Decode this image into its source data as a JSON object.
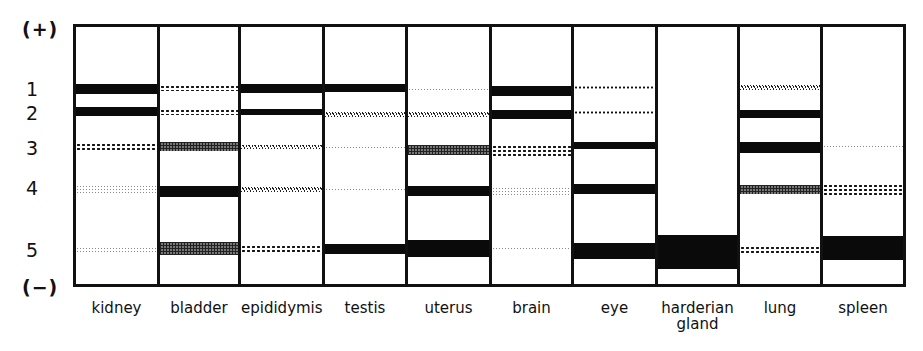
{
  "figure": {
    "pole_top": "(+)",
    "pole_bottom": "(−)",
    "band_numbers": [
      {
        "label": "1",
        "y": 78
      },
      {
        "label": "2",
        "y": 102
      },
      {
        "label": "3",
        "y": 137
      },
      {
        "label": "4",
        "y": 177
      },
      {
        "label": "5",
        "y": 239
      }
    ],
    "pattern_legend": {
      "solid": "solid black (strong)",
      "dense": "dense crosshatch (medium-strong)",
      "dotted": "coarse dots (medium)",
      "wavy": "wavy stipple (weak-medium)",
      "light": "fine grey stipple (weak)",
      "thin": "thin dotted line (trace)"
    },
    "band_rows": {
      "1": {
        "top": 84,
        "height": 9
      },
      "2": {
        "top": 108,
        "height": 8
      },
      "3": {
        "top": 143,
        "height": 10
      },
      "4": {
        "top": 184,
        "height": 12
      },
      "5": {
        "top": 241,
        "height": 15
      }
    },
    "lanes": [
      {
        "label": "kidney",
        "label2": "",
        "x": 76,
        "w": 81,
        "bands": [
          {
            "row": 1,
            "pattern": "solid",
            "top": 84,
            "height": 10
          },
          {
            "row": 2,
            "pattern": "solid",
            "top": 107,
            "height": 9
          },
          {
            "row": 3,
            "pattern": "dotted",
            "top": 143,
            "height": 9
          },
          {
            "row": 4,
            "pattern": "light",
            "top": 185,
            "height": 8
          },
          {
            "row": 5,
            "pattern": "light",
            "top": 247,
            "height": 5
          }
        ]
      },
      {
        "label": "bladder",
        "label2": "",
        "x": 160,
        "w": 78,
        "bands": [
          {
            "row": 1,
            "pattern": "dotted",
            "top": 85,
            "height": 6
          },
          {
            "row": 2,
            "pattern": "dotted",
            "top": 109,
            "height": 6
          },
          {
            "row": 3,
            "pattern": "dense",
            "top": 142,
            "height": 9
          },
          {
            "row": 4,
            "pattern": "solid",
            "top": 186,
            "height": 11
          },
          {
            "row": 5,
            "pattern": "dense",
            "top": 242,
            "height": 13
          }
        ]
      },
      {
        "label": "epididymis",
        "label2": "",
        "x": 241,
        "w": 81,
        "bands": [
          {
            "row": 1,
            "pattern": "solid",
            "top": 84,
            "height": 9
          },
          {
            "row": 2,
            "pattern": "solid",
            "top": 109,
            "height": 6
          },
          {
            "row": 3,
            "pattern": "wavy",
            "top": 145,
            "height": 4
          },
          {
            "row": 4,
            "pattern": "wavy",
            "top": 187,
            "height": 5
          },
          {
            "row": 5,
            "pattern": "dotted",
            "top": 245,
            "height": 9
          }
        ]
      },
      {
        "label": "testis",
        "label2": "",
        "x": 325,
        "w": 80,
        "bands": [
          {
            "row": 1,
            "pattern": "solid",
            "top": 84,
            "height": 8
          },
          {
            "row": 2,
            "pattern": "wavy",
            "top": 112,
            "height": 5
          },
          {
            "row": 3,
            "pattern": "light",
            "top": 146,
            "height": 4
          },
          {
            "row": 4,
            "pattern": "light",
            "top": 188,
            "height": 4
          },
          {
            "row": 5,
            "pattern": "solid",
            "top": 244,
            "height": 10
          }
        ]
      },
      {
        "label": "uterus",
        "label2": "",
        "x": 408,
        "w": 81,
        "bands": [
          {
            "row": 1,
            "pattern": "light",
            "top": 88,
            "height": 4
          },
          {
            "row": 2,
            "pattern": "wavy",
            "top": 112,
            "height": 5
          },
          {
            "row": 3,
            "pattern": "dense",
            "top": 145,
            "height": 10
          },
          {
            "row": 4,
            "pattern": "solid",
            "top": 186,
            "height": 10
          },
          {
            "row": 5,
            "pattern": "solid",
            "top": 240,
            "height": 17
          }
        ]
      },
      {
        "label": "brain",
        "label2": "",
        "x": 492,
        "w": 79,
        "bands": [
          {
            "row": 1,
            "pattern": "solid",
            "top": 86,
            "height": 10
          },
          {
            "row": 2,
            "pattern": "solid",
            "top": 110,
            "height": 9
          },
          {
            "row": 3,
            "pattern": "dotted",
            "top": 145,
            "height": 11
          },
          {
            "row": 4,
            "pattern": "light",
            "top": 187,
            "height": 8
          },
          {
            "row": 5,
            "pattern": "light",
            "top": 247,
            "height": 4
          }
        ]
      },
      {
        "label": "eye",
        "label2": "",
        "x": 574,
        "w": 81,
        "bands": [
          {
            "row": 1,
            "pattern": "thin",
            "top": 86,
            "height": 3
          },
          {
            "row": 2,
            "pattern": "thin",
            "top": 111,
            "height": 3
          },
          {
            "row": 3,
            "pattern": "solid",
            "top": 142,
            "height": 7
          },
          {
            "row": 4,
            "pattern": "solid",
            "top": 184,
            "height": 10
          },
          {
            "row": 5,
            "pattern": "solid",
            "top": 243,
            "height": 16
          }
        ]
      },
      {
        "label": "harderian",
        "label2": "gland",
        "x": 658,
        "w": 79,
        "bands": [
          {
            "row": 5,
            "pattern": "solid",
            "top": 235,
            "height": 34
          }
        ]
      },
      {
        "label": "lung",
        "label2": "",
        "x": 740,
        "w": 80,
        "bands": [
          {
            "row": 1,
            "pattern": "wavy",
            "top": 85,
            "height": 5
          },
          {
            "row": 2,
            "pattern": "solid",
            "top": 110,
            "height": 8
          },
          {
            "row": 3,
            "pattern": "solid",
            "top": 142,
            "height": 11
          },
          {
            "row": 4,
            "pattern": "dense",
            "top": 185,
            "height": 9
          },
          {
            "row": 5,
            "pattern": "dotted",
            "top": 246,
            "height": 7
          }
        ]
      },
      {
        "label": "spleen",
        "label2": "",
        "x": 823,
        "w": 80,
        "bands": [
          {
            "row": 3,
            "pattern": "light",
            "top": 145,
            "height": 4
          },
          {
            "row": 4,
            "pattern": "dotted",
            "top": 184,
            "height": 12
          },
          {
            "row": 5,
            "pattern": "solid",
            "top": 236,
            "height": 24
          }
        ]
      }
    ]
  }
}
